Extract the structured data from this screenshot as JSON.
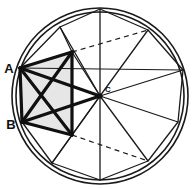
{
  "figure": {
    "background_color": "#ffffff",
    "stroke_color": "#1a1a1a",
    "shade_color": "#e6e6e6",
    "canvas": {
      "width": 192,
      "height": 189
    }
  },
  "circle": {
    "name": "outer-circle",
    "center": {
      "x": 100,
      "y": 96,
      "label": "C"
    },
    "radius_outer": 88,
    "radius_inner": 84,
    "stroke_width": 1.6
  },
  "labels": {
    "point_a": "A",
    "point_b": "B",
    "point_c": "C"
  },
  "polygon": {
    "name": "inscribed-decagon",
    "sides": 10,
    "stroke_width": 1.3,
    "vertices": [
      {
        "id": "V0",
        "x": 100,
        "y": 9
      },
      {
        "id": "V1",
        "x": 148,
        "y": 30
      },
      {
        "id": "V2",
        "x": 183,
        "y": 70
      },
      {
        "id": "V3",
        "x": 178,
        "y": 122
      },
      {
        "id": "V4",
        "x": 148,
        "y": 161
      },
      {
        "id": "V5",
        "x": 100,
        "y": 180
      },
      {
        "id": "V6",
        "x": 52,
        "y": 163
      },
      {
        "id": "V7",
        "x": 22,
        "y": 122,
        "label": "B"
      },
      {
        "id": "V8",
        "x": 20,
        "y": 68,
        "label": "A"
      },
      {
        "id": "V9",
        "x": 60,
        "y": 27
      }
    ]
  },
  "radii": {
    "name": "center-radii",
    "stroke_width": 1.3,
    "targets": [
      "V0",
      "V1",
      "V2",
      "V3",
      "V4",
      "V5",
      "V6",
      "V7",
      "V8",
      "V9"
    ]
  },
  "chords_thin": {
    "name": "thin-chords",
    "stroke_width": 1.2,
    "segments": [
      {
        "from": {
          "x": 20,
          "y": 68
        },
        "to": {
          "x": 183,
          "y": 70
        }
      },
      {
        "from": {
          "x": 20,
          "y": 68
        },
        "to": {
          "x": 72,
          "y": 52
        }
      },
      {
        "from": {
          "x": 72,
          "y": 52
        },
        "to": {
          "x": 60,
          "y": 27
        }
      },
      {
        "from": {
          "x": 22,
          "y": 122
        },
        "to": {
          "x": 72,
          "y": 135
        }
      },
      {
        "from": {
          "x": 72,
          "y": 135
        },
        "to": {
          "x": 52,
          "y": 163
        }
      },
      {
        "from": {
          "x": 72,
          "y": 52
        },
        "to": {
          "x": 100,
          "y": 96
        }
      },
      {
        "from": {
          "x": 72,
          "y": 135
        },
        "to": {
          "x": 100,
          "y": 96
        }
      }
    ]
  },
  "chords_bold": {
    "name": "bold-chords",
    "stroke_width": 3.2,
    "segments": [
      {
        "label": "A-to-center",
        "from": {
          "x": 20,
          "y": 68
        },
        "to": {
          "x": 100,
          "y": 96
        }
      },
      {
        "label": "B-to-center",
        "from": {
          "x": 22,
          "y": 122
        },
        "to": {
          "x": 100,
          "y": 96
        }
      },
      {
        "label": "A-to-B",
        "from": {
          "x": 20,
          "y": 68
        },
        "to": {
          "x": 22,
          "y": 122
        }
      },
      {
        "label": "A-to-lower-node",
        "from": {
          "x": 20,
          "y": 68
        },
        "to": {
          "x": 72,
          "y": 135
        }
      },
      {
        "label": "B-to-upper-node",
        "from": {
          "x": 22,
          "y": 122
        },
        "to": {
          "x": 72,
          "y": 52
        }
      },
      {
        "label": "upper-node-to-lower-node",
        "from": {
          "x": 72,
          "y": 52
        },
        "to": {
          "x": 72,
          "y": 135
        }
      },
      {
        "label": "A-to-upper-node",
        "from": {
          "x": 20,
          "y": 68
        },
        "to": {
          "x": 72,
          "y": 52
        }
      },
      {
        "label": "B-to-lower-node",
        "from": {
          "x": 22,
          "y": 122
        },
        "to": {
          "x": 72,
          "y": 135
        }
      }
    ]
  },
  "dashed": {
    "name": "dashed-construction-lines",
    "stroke_width": 1.2,
    "dash_pattern": "5,4",
    "segments": [
      {
        "label": "upper-dashed",
        "from": {
          "x": 72,
          "y": 52
        },
        "to": {
          "x": 148,
          "y": 30
        }
      },
      {
        "label": "lower-dashed",
        "from": {
          "x": 72,
          "y": 135
        },
        "to": {
          "x": 148,
          "y": 161
        }
      }
    ]
  },
  "shaded_region": {
    "name": "shaded-quadrilateral",
    "fill": "#e6e6e6",
    "points": "20,68 72,52 72,135 22,122"
  }
}
